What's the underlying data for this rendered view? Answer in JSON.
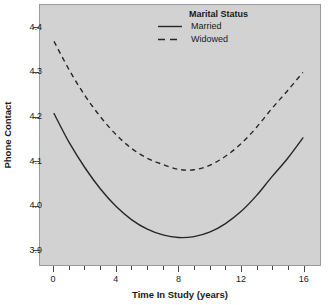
{
  "chart_data": {
    "type": "line",
    "title": "",
    "xlabel": "Time In Study (years)",
    "ylabel": "Phone Contact",
    "xlim": [
      -0.9,
      17.1
    ],
    "ylim": [
      3.865,
      4.452
    ],
    "grid": false,
    "legend": {
      "title": "Marital Status",
      "position": "top-right",
      "entries": [
        {
          "label": "Married",
          "style": "solid"
        },
        {
          "label": "Widowed",
          "style": "dashed"
        }
      ]
    },
    "xticks": [
      0,
      4,
      8,
      12,
      16
    ],
    "xticklabels": [
      "0",
      "4",
      "8",
      "12",
      "16"
    ],
    "xminorticks": [
      1,
      2,
      3,
      5,
      6,
      7,
      9,
      10,
      11,
      13,
      14,
      15
    ],
    "yticks": [
      3.9,
      4.0,
      4.1,
      4.2,
      4.3,
      4.4
    ],
    "yticklabels": [
      "3.9",
      "4.0",
      "4.1",
      "4.2",
      "4.3",
      "4.4"
    ],
    "colors": {
      "panel_background": "#d2d2d2",
      "figure_background": "#ffffff",
      "line": "#262626",
      "axis": "#4a4a4a"
    },
    "series": [
      {
        "name": "Married",
        "style": "solid",
        "x": [
          0,
          1,
          2,
          3,
          4,
          5,
          6,
          7,
          8,
          9,
          10,
          11,
          12,
          13,
          14,
          15,
          16
        ],
        "values": [
          4.207,
          4.14,
          4.084,
          4.036,
          3.997,
          3.967,
          3.946,
          3.933,
          3.927,
          3.929,
          3.939,
          3.958,
          3.985,
          4.021,
          4.064,
          4.105,
          4.152
        ]
      },
      {
        "name": "Widowed",
        "style": "dashed",
        "x": [
          0,
          1,
          2,
          3,
          4,
          5,
          6,
          7,
          8,
          9,
          10,
          11,
          12,
          13,
          14,
          15,
          16
        ],
        "values": [
          4.37,
          4.304,
          4.247,
          4.199,
          4.159,
          4.128,
          4.106,
          4.092,
          4.081,
          4.08,
          4.09,
          4.11,
          4.138,
          4.175,
          4.218,
          4.258,
          4.3
        ]
      }
    ]
  }
}
